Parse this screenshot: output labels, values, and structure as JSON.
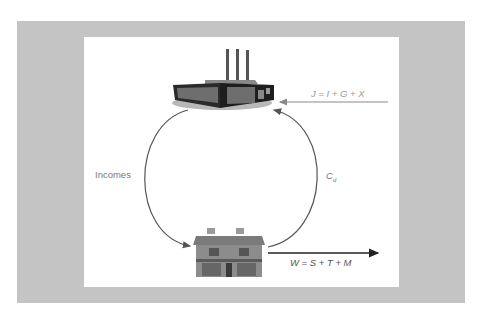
{
  "diagram": {
    "type": "circular-flow-of-income",
    "nodes": [
      {
        "id": "firms",
        "icon": "factory-icon"
      },
      {
        "id": "households",
        "icon": "house-icon"
      }
    ],
    "labels": {
      "incomes": "Incomes",
      "consumption_main": "C",
      "consumption_sub": "d",
      "injections": "J = I + G + X",
      "withdrawals": "W = S + T + M"
    },
    "flows": [
      {
        "from": "firms",
        "to": "households",
        "label": "Incomes"
      },
      {
        "from": "households",
        "to": "firms",
        "label": "Cd"
      },
      {
        "from": "outside",
        "to": "firms",
        "label": "J = I + G + X"
      },
      {
        "from": "households",
        "to": "outside",
        "label": "W = S + T + M"
      }
    ],
    "colors": {
      "frame": "#c4c4c4",
      "panel": "#ffffff",
      "arrow": "#555555",
      "injection_arrow": "#8a8a8a",
      "label": "#7a7a7a"
    }
  }
}
